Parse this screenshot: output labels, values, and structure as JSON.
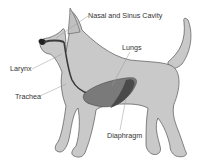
{
  "diagram": {
    "labels": {
      "nasal": "Nasal and Sinus Cavity",
      "lungs": "Lungs",
      "larynx": "Larynx",
      "trachea": "Trachea",
      "diaphragm": "Diaphragm"
    },
    "colors": {
      "body_fill": "#c9c9c9",
      "body_stroke": "#555555",
      "lung_fill": "#7a7a7a",
      "lung_dark": "#4a4a4a",
      "trachea": "#3a3a3a",
      "leader_line": "#999999",
      "text": "#333333"
    }
  }
}
